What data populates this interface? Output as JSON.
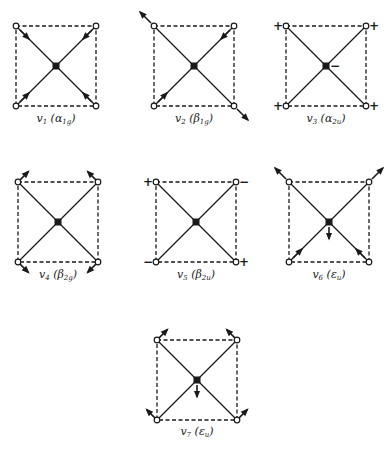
{
  "figure": {
    "modes": [
      {
        "id": "v1",
        "mode": "v",
        "sub": "1",
        "sym_letter": "α",
        "sym_sub": "1g",
        "cx": 56,
        "cy": 66,
        "caption_y": 118,
        "arrows": [
          {
            "atom": "tl",
            "dir": "in"
          },
          {
            "atom": "tr",
            "dir": "in"
          },
          {
            "atom": "bl",
            "dir": "in"
          },
          {
            "atom": "br",
            "dir": "in"
          }
        ],
        "center": "none"
      },
      {
        "id": "v2",
        "mode": "v",
        "sub": "2",
        "sym_letter": "β",
        "sym_sub": "1g",
        "cx": 194,
        "cy": 66,
        "caption_y": 118,
        "arrows": [
          {
            "atom": "tl",
            "dir": "out"
          },
          {
            "atom": "tr",
            "dir": "in"
          },
          {
            "atom": "bl",
            "dir": "in"
          },
          {
            "atom": "br",
            "dir": "out"
          }
        ],
        "center": "none"
      },
      {
        "id": "v3",
        "mode": "v",
        "sub": "3",
        "sym_letter": "α",
        "sym_sub": "2u",
        "cx": 326,
        "cy": 66,
        "caption_y": 118,
        "signs": [
          {
            "atom": "tl",
            "sign": "+"
          },
          {
            "atom": "tr",
            "sign": "+"
          },
          {
            "atom": "bl",
            "sign": "+"
          },
          {
            "atom": "br",
            "sign": "+"
          }
        ],
        "center": "minus"
      },
      {
        "id": "v4",
        "mode": "v",
        "sub": "4",
        "sym_letter": "β",
        "sym_sub": "2g",
        "cx": 58,
        "cy": 222,
        "caption_y": 274,
        "arrows": [
          {
            "atom": "tl",
            "dir": "tan-up"
          },
          {
            "atom": "tr",
            "dir": "tan-up"
          },
          {
            "atom": "bl",
            "dir": "tan-down"
          },
          {
            "atom": "br",
            "dir": "tan-down"
          }
        ],
        "center": "none"
      },
      {
        "id": "v5",
        "mode": "v",
        "sub": "5",
        "sym_letter": "β",
        "sym_sub": "2u",
        "cx": 196,
        "cy": 222,
        "caption_y": 274,
        "signs": [
          {
            "atom": "tl",
            "sign": "+"
          },
          {
            "atom": "tr",
            "sign": "−"
          },
          {
            "atom": "bl",
            "sign": "−"
          },
          {
            "atom": "br",
            "sign": "+"
          }
        ],
        "center": "none"
      },
      {
        "id": "v6",
        "mode": "v",
        "sub": "6",
        "sym_letter": "ε",
        "sym_sub": "u",
        "cx": 329,
        "cy": 222,
        "caption_y": 274,
        "arrows": [
          {
            "atom": "tl",
            "dir": "out"
          },
          {
            "atom": "tr",
            "dir": "out"
          },
          {
            "atom": "bl",
            "dir": "in"
          },
          {
            "atom": "br",
            "dir": "in"
          }
        ],
        "center": "down"
      },
      {
        "id": "v7",
        "mode": "v",
        "sub": "7",
        "sym_letter": "ε",
        "sym_sub": "u",
        "cx": 197,
        "cy": 380,
        "caption_y": 431,
        "arrows": [
          {
            "atom": "tl",
            "dir": "tan-up"
          },
          {
            "atom": "tr",
            "dir": "tan-up2"
          },
          {
            "atom": "bl",
            "dir": "tan-down"
          },
          {
            "atom": "br",
            "dir": "tan-down2"
          }
        ],
        "center": "down"
      }
    ],
    "half_size": 40,
    "colors": {
      "ink": "#1a1a1a",
      "background": "#ffffff"
    }
  }
}
